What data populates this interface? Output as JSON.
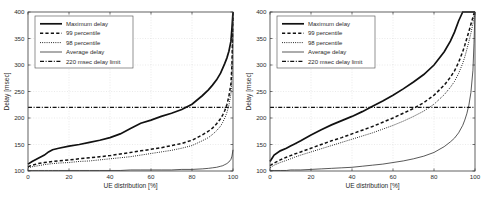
{
  "figure": {
    "panel_count": 2,
    "shared": {
      "xlabel": "UE distribution [%]",
      "ylabel": "Delay [msec]",
      "xticks": [
        "0",
        "20",
        "40",
        "60",
        "80",
        "100"
      ],
      "yticks": [
        "100",
        "150",
        "200",
        "250",
        "300",
        "350",
        "400"
      ],
      "legend": [
        {
          "label": "Maximum delay",
          "style": "solid-thick"
        },
        {
          "label": "99 percentile",
          "style": "dashed"
        },
        {
          "label": "98 percentile",
          "style": "dotted"
        },
        {
          "label": "Average delay",
          "style": "solid-thin"
        },
        {
          "label": "220 msec delay limit",
          "style": "dash-dot"
        }
      ]
    }
  },
  "chart_data": [
    {
      "type": "line",
      "title": "",
      "panel": "left",
      "xlabel": "UE distribution [%]",
      "ylabel": "Delay [msec]",
      "xlim": [
        0,
        100
      ],
      "ylim": [
        100,
        400
      ],
      "xticks": [
        0,
        20,
        40,
        60,
        80,
        100
      ],
      "yticks": [
        100,
        150,
        200,
        250,
        300,
        350,
        400
      ],
      "grid": true,
      "legend_position": "top-left",
      "x": [
        0,
        2,
        5,
        8,
        10,
        12,
        15,
        20,
        25,
        30,
        35,
        40,
        45,
        50,
        55,
        60,
        65,
        70,
        75,
        80,
        85,
        88,
        90,
        92,
        94,
        95,
        96,
        97,
        98,
        99,
        99.5,
        100
      ],
      "series": [
        {
          "name": "Maximum delay",
          "values": [
            113,
            118,
            124,
            130,
            136,
            140,
            143,
            147,
            150,
            154,
            158,
            163,
            170,
            180,
            190,
            196,
            203,
            209,
            216,
            226,
            242,
            253,
            262,
            272,
            285,
            294,
            303,
            313,
            326,
            345,
            370,
            400
          ]
        },
        {
          "name": "99 percentile",
          "values": [
            108,
            111,
            114,
            116,
            117,
            118,
            119,
            121,
            123,
            125,
            127,
            129,
            132,
            135,
            138,
            141,
            144,
            148,
            152,
            158,
            168,
            175,
            181,
            189,
            199,
            206,
            214,
            225,
            241,
            265,
            300,
            400
          ]
        },
        {
          "name": "98 percentile",
          "values": [
            106,
            108,
            110,
            112,
            113,
            114,
            115,
            116,
            118,
            119,
            121,
            123,
            125,
            127,
            130,
            133,
            136,
            139,
            143,
            148,
            157,
            163,
            169,
            176,
            185,
            192,
            200,
            210,
            224,
            246,
            278,
            390
          ]
        },
        {
          "name": "Average delay",
          "values": [
            101,
            101,
            101,
            101,
            101,
            101,
            101,
            101,
            101,
            101,
            101,
            101,
            101,
            102,
            102,
            102,
            102,
            102,
            103,
            103,
            104,
            105,
            106,
            107,
            109,
            110,
            112,
            114,
            117,
            122,
            128,
            140
          ]
        },
        {
          "name": "220 msec delay limit",
          "values": [
            220,
            220,
            220,
            220,
            220,
            220,
            220,
            220,
            220,
            220,
            220,
            220,
            220,
            220,
            220,
            220,
            220,
            220,
            220,
            220,
            220,
            220,
            220,
            220,
            220,
            220,
            220,
            220,
            220,
            220,
            220,
            220
          ]
        }
      ]
    },
    {
      "type": "line",
      "title": "",
      "panel": "right",
      "xlabel": "UE distribution [%]",
      "ylabel": "Delay [msec]",
      "xlim": [
        0,
        100
      ],
      "ylim": [
        100,
        400
      ],
      "xticks": [
        0,
        20,
        40,
        60,
        80,
        100
      ],
      "yticks": [
        100,
        150,
        200,
        250,
        300,
        350,
        400
      ],
      "grid": true,
      "legend_position": "top-left",
      "x": [
        0,
        2,
        5,
        8,
        10,
        12,
        15,
        20,
        25,
        30,
        35,
        40,
        45,
        50,
        55,
        60,
        65,
        70,
        75,
        80,
        85,
        88,
        90,
        92,
        94,
        95,
        96,
        97,
        98,
        99,
        99.5,
        100
      ],
      "series": [
        {
          "name": "Maximum delay",
          "values": [
            118,
            130,
            138,
            143,
            147,
            151,
            157,
            168,
            178,
            187,
            195,
            203,
            212,
            222,
            232,
            243,
            255,
            268,
            282,
            300,
            325,
            345,
            362,
            383,
            400,
            400,
            400,
            400,
            400,
            400,
            400,
            400
          ]
        },
        {
          "name": "99 percentile",
          "values": [
            110,
            115,
            121,
            126,
            129,
            132,
            136,
            143,
            150,
            157,
            163,
            170,
            177,
            184,
            192,
            200,
            209,
            218,
            229,
            243,
            262,
            277,
            289,
            305,
            325,
            337,
            350,
            363,
            377,
            390,
            397,
            400
          ]
        },
        {
          "name": "98 percentile",
          "values": [
            106,
            111,
            116,
            120,
            123,
            126,
            130,
            136,
            142,
            148,
            154,
            160,
            166,
            172,
            179,
            186,
            194,
            203,
            213,
            226,
            244,
            258,
            269,
            284,
            303,
            315,
            329,
            344,
            360,
            378,
            390,
            398
          ]
        },
        {
          "name": "Average delay",
          "values": [
            101,
            101,
            101,
            101,
            102,
            102,
            102,
            103,
            104,
            105,
            106,
            107,
            109,
            111,
            113,
            116,
            119,
            123,
            128,
            135,
            146,
            155,
            162,
            172,
            186,
            196,
            208,
            224,
            248,
            290,
            340,
            400
          ]
        },
        {
          "name": "220 msec delay limit",
          "values": [
            220,
            220,
            220,
            220,
            220,
            220,
            220,
            220,
            220,
            220,
            220,
            220,
            220,
            220,
            220,
            220,
            220,
            220,
            220,
            220,
            220,
            220,
            220,
            220,
            220,
            220,
            220,
            220,
            220,
            220,
            220,
            220
          ]
        }
      ]
    }
  ]
}
